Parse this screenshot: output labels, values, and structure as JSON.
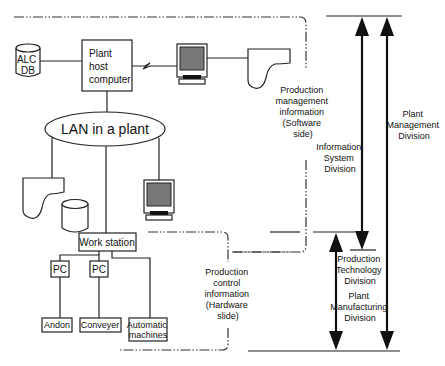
{
  "diagram": {
    "nodes": {
      "alc_db": [
        "ALC",
        "DB"
      ],
      "host_computer": [
        "Plant",
        "host",
        "computer"
      ],
      "lan": "LAN in a plant",
      "work_station": "Work station",
      "pc1": "PC",
      "pc2": "PC",
      "andon": "Andon",
      "conveyer": "Conveyer",
      "automatic_machines": [
        "Automatic",
        "machines"
      ]
    },
    "regions": {
      "software": [
        "Production",
        "management",
        "information",
        "(Software",
        "side)"
      ],
      "hardware": [
        "Production",
        "control",
        "information",
        "(Hardware",
        "slide)"
      ]
    },
    "divisions": {
      "information_system": [
        "Information",
        "System",
        "Division"
      ],
      "production_technology": [
        "Production",
        "Technology",
        "Division"
      ],
      "plant_manufacturing": [
        "Plant",
        "Manufacturing",
        "Division"
      ],
      "plant_management": [
        "Plant",
        "Management",
        "Division"
      ]
    },
    "colors": {
      "line": "#222222",
      "screen": "#777777",
      "background": "#ffffff"
    }
  }
}
